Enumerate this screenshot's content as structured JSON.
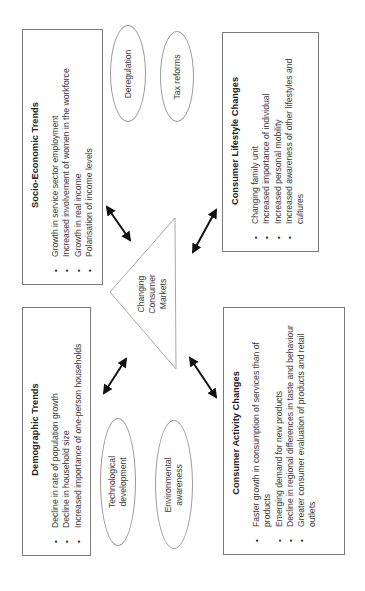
{
  "diagram": {
    "orientation": "rotated-90-ccw",
    "center": {
      "shape": "triangle",
      "label_lines": [
        "Changing",
        "Consumer",
        "Markets"
      ]
    },
    "boxes": {
      "socio_economic": {
        "title": "Socio-Economic Trends",
        "items": [
          "Growth in service sector employment",
          "Increased involvement of women in the workforce",
          "Growth in real income",
          "Polarisation of income levels"
        ]
      },
      "lifestyle": {
        "title": "Consumer Lifestyle Changes",
        "items": [
          "Changing family unit",
          "Increased importance of individual",
          "Increased personal mobility",
          "Increased awareness of other lifestyles and cultures"
        ]
      },
      "demographic": {
        "title": "Demographic Trends",
        "items": [
          "Decline in rate of population growth",
          "Decline in household size",
          "Increased importance of one-person households"
        ]
      },
      "activity": {
        "title": "Consumer Activity Changes",
        "items": [
          "Faster growth in consumption of services than of products",
          "Emerging demand for new products",
          "Decline in regional differences in taste and behaviour",
          "Greater consumer evaluation of products and retail outlets"
        ]
      }
    },
    "ellipses": {
      "deregulation": {
        "lines": [
          "Deregulation"
        ]
      },
      "tax_reforms": {
        "lines": [
          "Tax reforms"
        ]
      },
      "technological": {
        "lines": [
          "Technological",
          "development"
        ]
      },
      "environmental": {
        "lines": [
          "Environmental",
          "awareness"
        ]
      }
    },
    "arrows": [
      {
        "from": "socio_economic",
        "to": "center"
      },
      {
        "from": "lifestyle",
        "to": "center"
      },
      {
        "from": "demographic",
        "to": "center"
      },
      {
        "from": "activity",
        "to": "center"
      }
    ],
    "colors": {
      "box_border": "#7a7a7a",
      "ellipse_border": "#9a9a9a",
      "triangle_stroke": "#a8a8a8",
      "arrow": "#111111",
      "text": "#3a3a3a"
    }
  }
}
